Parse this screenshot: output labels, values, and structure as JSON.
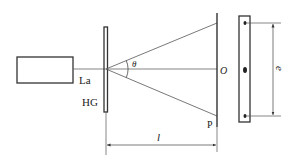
{
  "diagram": {
    "type": "optics-setup",
    "labels": {
      "laser": "La",
      "grating": "HG",
      "angle": "θ",
      "center_point": "O",
      "screen_point": "P",
      "distance": "l",
      "spot_separation": "e"
    },
    "colors": {
      "line": "#333333",
      "thin_line": "#555555",
      "background": "#ffffff"
    }
  }
}
